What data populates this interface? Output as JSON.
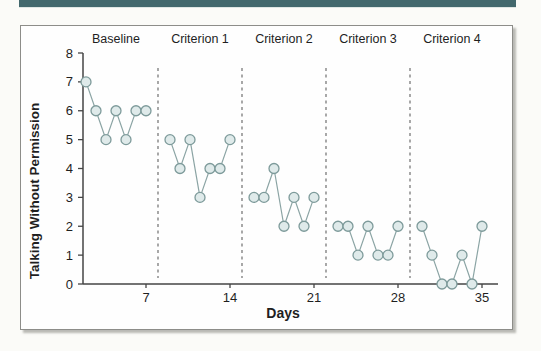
{
  "page": {
    "accent_bar_color": "#43686d"
  },
  "chart_data": {
    "type": "line",
    "title": "",
    "xlabel": "Days",
    "ylabel": "Talking Without Permission",
    "xlim": [
      0,
      36
    ],
    "ylim": [
      0,
      8
    ],
    "x_ticks": [
      7,
      14,
      21,
      28,
      35
    ],
    "y_ticks": [
      0,
      1,
      2,
      3,
      4,
      5,
      6,
      7,
      8
    ],
    "grid": "off",
    "legend": "none",
    "marker": "open-circle",
    "dividers_after_days": [
      7,
      14,
      21,
      28
    ],
    "phases": [
      {
        "label": "Baseline",
        "days": [
          1,
          2,
          3,
          4,
          5,
          6,
          7
        ],
        "values": [
          7,
          6,
          5,
          6,
          5,
          6,
          6
        ]
      },
      {
        "label": "Criterion 1",
        "days": [
          8,
          9,
          10,
          11,
          12,
          13,
          14
        ],
        "values": [
          5,
          4,
          5,
          3,
          4,
          4,
          5
        ]
      },
      {
        "label": "Criterion 2",
        "days": [
          15,
          16,
          17,
          18,
          19,
          20,
          21
        ],
        "values": [
          3,
          3,
          4,
          2,
          3,
          2,
          3
        ]
      },
      {
        "label": "Criterion 3",
        "days": [
          22,
          23,
          24,
          25,
          26,
          27,
          28
        ],
        "values": [
          2,
          2,
          1,
          2,
          1,
          1,
          2
        ]
      },
      {
        "label": "Criterion 4",
        "days": [
          29,
          30,
          31,
          32,
          33,
          34,
          35
        ],
        "values": [
          2,
          1,
          0,
          0,
          1,
          0,
          2
        ]
      }
    ],
    "colors": {
      "marker_fill": "#dfeaea",
      "marker_stroke": "#7d9a9a",
      "series_line": "#8ba4a4",
      "axis": "#454545",
      "divider": "#6e6e6e",
      "text": "#1f1f1f"
    }
  }
}
